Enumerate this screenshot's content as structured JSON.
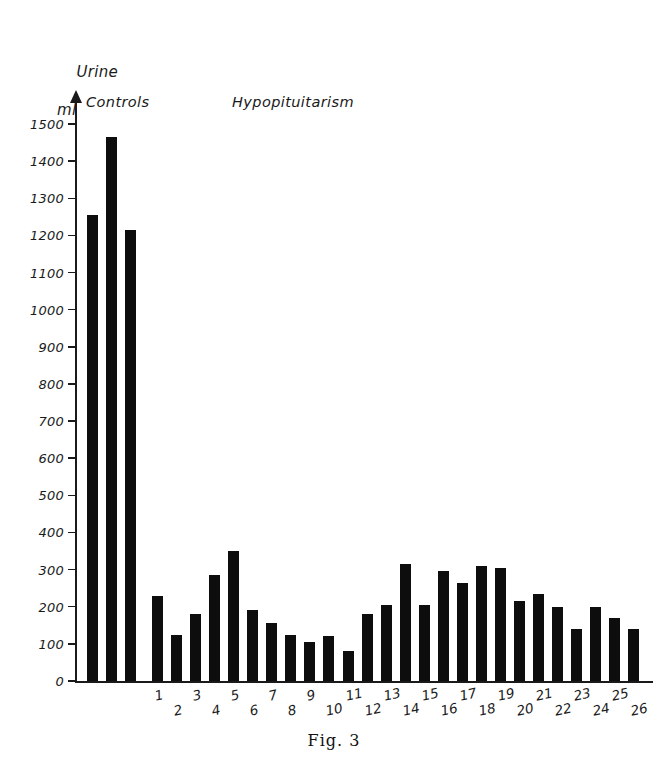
{
  "caption": "Fig. 3",
  "axis_title": {
    "line1": "Urine",
    "line2": "ml"
  },
  "groups": {
    "controls_label": "Controls",
    "hypopituitarism_label": "Hypopituitarism"
  },
  "chart_data": {
    "type": "bar",
    "title": "",
    "subtitle": "",
    "xlabel": "",
    "ylabel": "Urine ml",
    "ylim": [
      0,
      1500
    ],
    "grid": false,
    "legend": "none",
    "y_ticks": [
      0,
      100,
      200,
      300,
      400,
      500,
      600,
      700,
      800,
      900,
      1000,
      1100,
      1200,
      1300,
      1400,
      1500
    ],
    "y_tick_labels": [
      "0",
      "100",
      "200",
      "300",
      "400",
      "500",
      "600",
      "700",
      "800",
      "900",
      "1000",
      "1100",
      "1200",
      "1300",
      "1400",
      "1500"
    ],
    "series": [
      {
        "name": "Controls",
        "categories": [
          "",
          "",
          ""
        ],
        "values": [
          1255,
          1465,
          1215
        ]
      },
      {
        "name": "Hypopituitarism",
        "categories": [
          "1",
          "2",
          "3",
          "4",
          "5",
          "6",
          "7",
          "8",
          "9",
          "10",
          "11",
          "12",
          "13",
          "14",
          "15",
          "16",
          "17",
          "18",
          "19",
          "20",
          "21",
          "22",
          "23",
          "24",
          "25",
          "26"
        ],
        "values": [
          230,
          125,
          180,
          285,
          350,
          190,
          155,
          125,
          105,
          120,
          80,
          180,
          205,
          315,
          205,
          295,
          265,
          310,
          305,
          215,
          235,
          200,
          140,
          200,
          170,
          140
        ]
      }
    ],
    "colors": {
      "bar": "#0d0d0d",
      "axis": "#1a1a1a",
      "background": "#ffffff"
    }
  }
}
